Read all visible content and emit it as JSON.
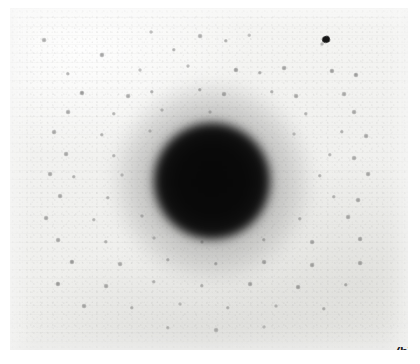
{
  "figure": {
    "panel_label": "(b)",
    "plate": {
      "left": 10,
      "top": 8,
      "width": 398,
      "height": 342,
      "background_color": "#f2f2f0",
      "border_color": "#ffffff"
    },
    "central_beam": {
      "name": "direct-beam-spot",
      "center_x": 212,
      "center_y": 181,
      "core_radius": 58,
      "halo_radius": 96,
      "core_color": "#060606",
      "halo_color": "#191919"
    },
    "defect": {
      "name": "emulsion-defect",
      "center_x": 322,
      "center_y": 36,
      "color": "#141414"
    },
    "colors": {
      "paper": "#f2f2f0",
      "paper_light": "#f7f7f5",
      "paper_shadow": "#ededea",
      "spot": "#141414",
      "label": "#1a1a1a"
    }
  },
  "chart_data": {
    "type": "scatter",
    "title": "",
    "subtitle": "",
    "xlabel": "",
    "ylabel": "",
    "xlim": [
      0,
      398
    ],
    "ylim": [
      0,
      342
    ],
    "grid": false,
    "legend": null,
    "annotations": [
      {
        "text": "(b)",
        "x": 386,
        "y": 337
      }
    ],
    "series": [
      {
        "name": "direct-beam",
        "marker": "filled-disc",
        "color": "#060606",
        "points": [
          {
            "x": 202,
            "y": 173,
            "size": 116,
            "intensity": 1.0
          }
        ]
      },
      {
        "name": "diffraction-reflections",
        "marker": "small-dot",
        "color": "#141414",
        "points": [
          {
            "x": 34,
            "y": 32,
            "size": 2.4,
            "intensity": 0.42
          },
          {
            "x": 141,
            "y": 24,
            "size": 2.0,
            "intensity": 0.34
          },
          {
            "x": 190,
            "y": 28,
            "size": 2.4,
            "intensity": 0.4
          },
          {
            "x": 216,
            "y": 33,
            "size": 2.2,
            "intensity": 0.38
          },
          {
            "x": 239,
            "y": 27,
            "size": 1.8,
            "intensity": 0.3
          },
          {
            "x": 92,
            "y": 47,
            "size": 2.6,
            "intensity": 0.46
          },
          {
            "x": 164,
            "y": 42,
            "size": 2.2,
            "intensity": 0.36
          },
          {
            "x": 312,
            "y": 36,
            "size": 2.0,
            "intensity": 0.34
          },
          {
            "x": 58,
            "y": 66,
            "size": 2.2,
            "intensity": 0.36
          },
          {
            "x": 130,
            "y": 62,
            "size": 2.0,
            "intensity": 0.32
          },
          {
            "x": 178,
            "y": 58,
            "size": 2.0,
            "intensity": 0.32
          },
          {
            "x": 226,
            "y": 62,
            "size": 2.6,
            "intensity": 0.48
          },
          {
            "x": 250,
            "y": 65,
            "size": 2.2,
            "intensity": 0.4
          },
          {
            "x": 274,
            "y": 60,
            "size": 2.4,
            "intensity": 0.44
          },
          {
            "x": 322,
            "y": 63,
            "size": 2.6,
            "intensity": 0.46
          },
          {
            "x": 346,
            "y": 67,
            "size": 2.6,
            "intensity": 0.46
          },
          {
            "x": 72,
            "y": 85,
            "size": 2.6,
            "intensity": 0.5
          },
          {
            "x": 118,
            "y": 88,
            "size": 2.4,
            "intensity": 0.42
          },
          {
            "x": 142,
            "y": 84,
            "size": 2.2,
            "intensity": 0.38
          },
          {
            "x": 190,
            "y": 82,
            "size": 2.2,
            "intensity": 0.38
          },
          {
            "x": 214,
            "y": 86,
            "size": 2.4,
            "intensity": 0.4
          },
          {
            "x": 262,
            "y": 84,
            "size": 2.2,
            "intensity": 0.36
          },
          {
            "x": 286,
            "y": 88,
            "size": 2.4,
            "intensity": 0.42
          },
          {
            "x": 334,
            "y": 86,
            "size": 2.4,
            "intensity": 0.42
          },
          {
            "x": 58,
            "y": 104,
            "size": 2.4,
            "intensity": 0.42
          },
          {
            "x": 104,
            "y": 106,
            "size": 2.2,
            "intensity": 0.36
          },
          {
            "x": 152,
            "y": 102,
            "size": 2.0,
            "intensity": 0.32
          },
          {
            "x": 200,
            "y": 104,
            "size": 2.0,
            "intensity": 0.3
          },
          {
            "x": 296,
            "y": 106,
            "size": 2.2,
            "intensity": 0.36
          },
          {
            "x": 344,
            "y": 104,
            "size": 2.4,
            "intensity": 0.42
          },
          {
            "x": 44,
            "y": 124,
            "size": 2.4,
            "intensity": 0.42
          },
          {
            "x": 92,
            "y": 127,
            "size": 2.2,
            "intensity": 0.36
          },
          {
            "x": 140,
            "y": 123,
            "size": 2.0,
            "intensity": 0.3
          },
          {
            "x": 284,
            "y": 126,
            "size": 2.0,
            "intensity": 0.3
          },
          {
            "x": 332,
            "y": 124,
            "size": 2.2,
            "intensity": 0.36
          },
          {
            "x": 356,
            "y": 128,
            "size": 2.4,
            "intensity": 0.42
          },
          {
            "x": 56,
            "y": 146,
            "size": 2.4,
            "intensity": 0.42
          },
          {
            "x": 104,
            "y": 148,
            "size": 2.2,
            "intensity": 0.34
          },
          {
            "x": 320,
            "y": 147,
            "size": 2.2,
            "intensity": 0.34
          },
          {
            "x": 344,
            "y": 150,
            "size": 2.4,
            "intensity": 0.4
          },
          {
            "x": 40,
            "y": 166,
            "size": 2.4,
            "intensity": 0.42
          },
          {
            "x": 64,
            "y": 169,
            "size": 2.2,
            "intensity": 0.36
          },
          {
            "x": 112,
            "y": 167,
            "size": 2.0,
            "intensity": 0.3
          },
          {
            "x": 310,
            "y": 168,
            "size": 2.2,
            "intensity": 0.34
          },
          {
            "x": 358,
            "y": 166,
            "size": 2.4,
            "intensity": 0.42
          },
          {
            "x": 50,
            "y": 188,
            "size": 2.4,
            "intensity": 0.42
          },
          {
            "x": 98,
            "y": 190,
            "size": 2.2,
            "intensity": 0.34
          },
          {
            "x": 324,
            "y": 189,
            "size": 2.2,
            "intensity": 0.34
          },
          {
            "x": 348,
            "y": 192,
            "size": 2.4,
            "intensity": 0.42
          },
          {
            "x": 36,
            "y": 210,
            "size": 2.4,
            "intensity": 0.42
          },
          {
            "x": 84,
            "y": 212,
            "size": 2.2,
            "intensity": 0.34
          },
          {
            "x": 132,
            "y": 208,
            "size": 2.0,
            "intensity": 0.3
          },
          {
            "x": 290,
            "y": 211,
            "size": 2.2,
            "intensity": 0.34
          },
          {
            "x": 338,
            "y": 209,
            "size": 2.4,
            "intensity": 0.4
          },
          {
            "x": 48,
            "y": 232,
            "size": 2.4,
            "intensity": 0.42
          },
          {
            "x": 96,
            "y": 234,
            "size": 2.2,
            "intensity": 0.36
          },
          {
            "x": 144,
            "y": 230,
            "size": 2.0,
            "intensity": 0.3
          },
          {
            "x": 192,
            "y": 234,
            "size": 2.0,
            "intensity": 0.28
          },
          {
            "x": 254,
            "y": 232,
            "size": 2.2,
            "intensity": 0.34
          },
          {
            "x": 302,
            "y": 234,
            "size": 2.4,
            "intensity": 0.4
          },
          {
            "x": 350,
            "y": 231,
            "size": 2.4,
            "intensity": 0.42
          },
          {
            "x": 62,
            "y": 254,
            "size": 2.6,
            "intensity": 0.48
          },
          {
            "x": 110,
            "y": 256,
            "size": 2.4,
            "intensity": 0.4
          },
          {
            "x": 158,
            "y": 252,
            "size": 2.2,
            "intensity": 0.34
          },
          {
            "x": 206,
            "y": 256,
            "size": 2.2,
            "intensity": 0.34
          },
          {
            "x": 254,
            "y": 254,
            "size": 2.4,
            "intensity": 0.4
          },
          {
            "x": 302,
            "y": 257,
            "size": 2.4,
            "intensity": 0.42
          },
          {
            "x": 350,
            "y": 255,
            "size": 2.4,
            "intensity": 0.42
          },
          {
            "x": 48,
            "y": 276,
            "size": 2.6,
            "intensity": 0.48
          },
          {
            "x": 96,
            "y": 278,
            "size": 2.4,
            "intensity": 0.4
          },
          {
            "x": 144,
            "y": 274,
            "size": 2.2,
            "intensity": 0.34
          },
          {
            "x": 192,
            "y": 278,
            "size": 2.2,
            "intensity": 0.34
          },
          {
            "x": 240,
            "y": 276,
            "size": 2.4,
            "intensity": 0.4
          },
          {
            "x": 288,
            "y": 279,
            "size": 2.4,
            "intensity": 0.42
          },
          {
            "x": 336,
            "y": 277,
            "size": 2.2,
            "intensity": 0.36
          },
          {
            "x": 74,
            "y": 298,
            "size": 2.4,
            "intensity": 0.4
          },
          {
            "x": 122,
            "y": 300,
            "size": 2.2,
            "intensity": 0.34
          },
          {
            "x": 170,
            "y": 296,
            "size": 2.0,
            "intensity": 0.28
          },
          {
            "x": 218,
            "y": 300,
            "size": 2.2,
            "intensity": 0.32
          },
          {
            "x": 266,
            "y": 298,
            "size": 2.0,
            "intensity": 0.3
          },
          {
            "x": 314,
            "y": 301,
            "size": 2.2,
            "intensity": 0.34
          },
          {
            "x": 158,
            "y": 320,
            "size": 2.2,
            "intensity": 0.32
          },
          {
            "x": 206,
            "y": 322,
            "size": 2.4,
            "intensity": 0.38
          },
          {
            "x": 254,
            "y": 319,
            "size": 2.0,
            "intensity": 0.28
          }
        ]
      }
    ]
  }
}
